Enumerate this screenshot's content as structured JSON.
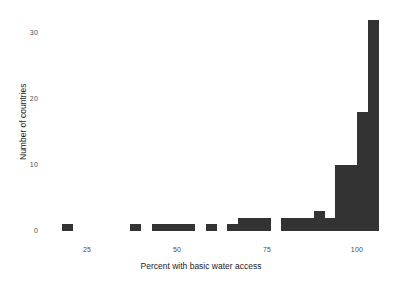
{
  "chart_data": {
    "type": "bar",
    "title": "",
    "subtitle": "",
    "xlabel": "Percent with basic water access",
    "ylabel": "Number of countries",
    "xlim": [
      12,
      103
    ],
    "ylim": [
      0,
      33
    ],
    "xticks": [
      25,
      50,
      75,
      100
    ],
    "xtick_labels": [
      "25",
      "50",
      "75",
      "100"
    ],
    "yticks": [
      0,
      10,
      20,
      30
    ],
    "ytick_labels": [
      "0",
      "10",
      "20",
      "30"
    ],
    "grid": false,
    "legend": "none",
    "bar_color": "#333333",
    "bin_width": 3,
    "categories": [
      "18-21",
      "37-40",
      "43-46",
      "46-49",
      "49-52",
      "52-55",
      "58-61",
      "64-67",
      "67-70",
      "70-73",
      "73-76",
      "79-82",
      "82-85",
      "85-88",
      "88-91",
      "91-94",
      "94-97",
      "97-100",
      "100-103"
    ],
    "bin_starts": [
      18,
      37,
      43,
      46,
      49,
      52,
      58,
      64,
      67,
      70,
      73,
      79,
      82,
      85,
      88,
      91,
      94,
      97,
      100
    ],
    "values": [
      1,
      1,
      1,
      1,
      1,
      1,
      1,
      1,
      2,
      2,
      2,
      2,
      2,
      2,
      3,
      2,
      10,
      10,
      18
    ],
    "tall_bar_value": 32
  },
  "axes": {
    "x_title": "Percent with basic water access",
    "y_title": "Number of countries"
  }
}
